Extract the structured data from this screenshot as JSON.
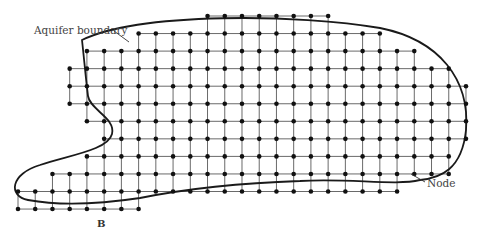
{
  "figure": {
    "type": "finite-difference-grid",
    "labels": {
      "aquifer_boundary": "Aquifer boundary",
      "node": "Node",
      "point_b": "B"
    },
    "colors": {
      "boundary": "#1a1a1a",
      "grid": "#6a6a6a",
      "node": "#111111",
      "text": "#444444"
    },
    "grid": {
      "x0": 18,
      "dx": 17.23,
      "y0": 16,
      "dy": 17.55,
      "node_radius": 2.3,
      "rows": [
        {
          "row": 0,
          "from": 11,
          "to": 18
        },
        {
          "row": 1,
          "from": 7,
          "to": 21
        },
        {
          "row": 2,
          "from": 4,
          "to": 23
        },
        {
          "row": 3,
          "from": 3,
          "to": 25
        },
        {
          "row": 4,
          "from": 3,
          "to": 26
        },
        {
          "row": 5,
          "from": 3,
          "to": 26
        },
        {
          "row": 6,
          "from": 4,
          "to": 26
        },
        {
          "row": 7,
          "from": 5,
          "to": 26
        },
        {
          "row": 8,
          "from": 4,
          "to": 25
        },
        {
          "row": 9,
          "from": 2,
          "to": 25
        },
        {
          "row": 10,
          "from": 0,
          "to": 22
        },
        {
          "row": 11,
          "from": 0,
          "to": 7
        }
      ]
    },
    "boundary_path": "M 82 40 C 140 12, 300 14, 380 28 C 440 40, 470 80, 466 130 C 462 170, 440 178, 420 180 C 395 186, 350 178, 300 181 C 240 183, 180 190, 140 198 C 100 204, 60 206, 28 200 C 8 196, 10 174, 40 165 C 70 155, 108 150, 112 134 C 116 118, 90 110, 88 96 C 86 80, 84 58, 82 40 Z",
    "leaders": {
      "aquifer_boundary": {
        "x1": 114,
        "y1": 31,
        "x2": 129,
        "y2": 42,
        "text_x": 34,
        "text_y": 34
      },
      "node": {
        "x1": 411,
        "y1": 174,
        "x2": 425,
        "y2": 182,
        "text_x": 427,
        "text_y": 187
      },
      "point_b": {
        "text_x": 97,
        "text_y": 227
      }
    }
  }
}
